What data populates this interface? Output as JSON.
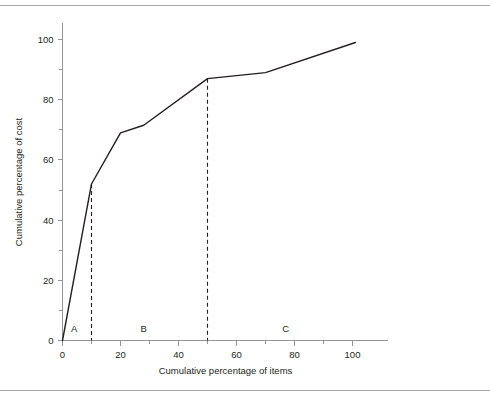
{
  "figure": {
    "top_rule": "horizontal-rule",
    "bottom_rule": "horizontal-rule"
  },
  "chart_data": {
    "type": "line",
    "title": "",
    "subtitle": "",
    "xlabel": "Cumulative percentage of items",
    "ylabel": "Cumulative percentage of cost",
    "xlim": [
      0,
      112
    ],
    "ylim": [
      0,
      107
    ],
    "grid": false,
    "legend": "none",
    "x_ticks_major": [
      0,
      20,
      40,
      60,
      80,
      100
    ],
    "x_ticks_major_labels": [
      "0",
      "20",
      "40",
      "60",
      "80",
      "100"
    ],
    "x_ticks_minor": [
      10,
      30,
      50,
      70,
      90
    ],
    "y_ticks_major": [
      0,
      20,
      40,
      60,
      80,
      100
    ],
    "y_ticks_major_labels": [
      "0",
      "20",
      "40",
      "60",
      "80",
      "100"
    ],
    "y_ticks_minor": [
      10,
      30,
      50,
      70,
      90
    ],
    "series": [
      {
        "name": "Cumulative cost curve",
        "x": [
          0,
          10,
          20,
          28,
          50,
          70,
          101
        ],
        "values": [
          0,
          52,
          69,
          71.5,
          87,
          89,
          99
        ]
      }
    ],
    "annotations": [
      {
        "label": "A",
        "x": 4,
        "y": 4
      },
      {
        "label": "B",
        "x": 28,
        "y": 4
      },
      {
        "label": "C",
        "x": 77,
        "y": 4
      }
    ],
    "dividers": [
      {
        "name": "divider-a-b",
        "x": 10,
        "y_top": 52
      },
      {
        "name": "divider-b-c",
        "x": 50,
        "y_top": 87
      }
    ],
    "colors": {
      "curve": "#231f20",
      "axis": "#939598",
      "rule": "#a7a9ac",
      "text": "#231f20"
    }
  }
}
